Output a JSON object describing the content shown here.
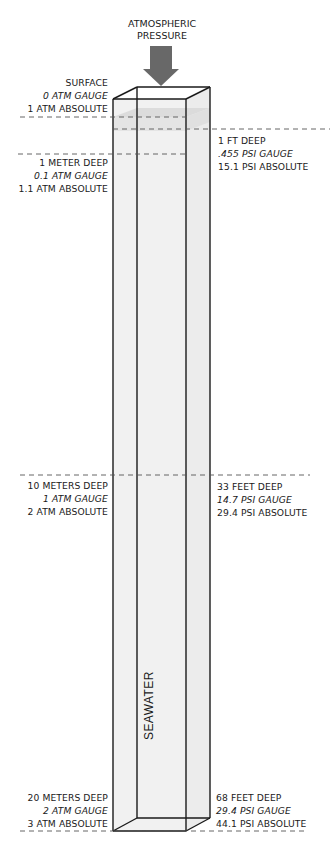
{
  "header": {
    "line1": "ATMOSPHERIC",
    "line2": "PRESSURE",
    "arrow_color": "#686868"
  },
  "container": {
    "label": "SEAWATER",
    "fill_color": "#f1f1f1",
    "shade_color": "#d8d8d8",
    "stroke_color": "#1a1a1a"
  },
  "levels": {
    "surface": {
      "left": [
        "SURFACE",
        "0 ATM GAUGE",
        "1 ATM ABSOLUTE"
      ]
    },
    "one_foot": {
      "right": [
        "1 FT DEEP",
        ".455 PSI GAUGE",
        "15.1 PSI ABSOLUTE"
      ]
    },
    "one_meter": {
      "left": [
        "1 METER DEEP",
        "0.1 ATM GAUGE",
        "1.1 ATM ABSOLUTE"
      ]
    },
    "ten_meters": {
      "left": [
        "10 METERS DEEP",
        "1 ATM GAUGE",
        "2 ATM ABSOLUTE"
      ],
      "right": [
        "33 FEET DEEP",
        "14.7 PSI GAUGE",
        "29.4 PSI ABSOLUTE"
      ]
    },
    "twenty_meters": {
      "left": [
        "20 METERS DEEP",
        "2 ATM GAUGE",
        "3 ATM ABSOLUTE"
      ],
      "right": [
        "68 FEET DEEP",
        "29.4 PSI GAUGE",
        "44.1 PSI ABSOLUTE"
      ]
    }
  },
  "guide_line_color": "#555555"
}
